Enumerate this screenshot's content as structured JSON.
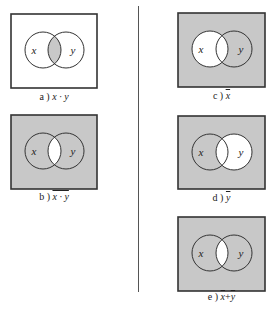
{
  "figure": {
    "colors": {
      "shade": "#c8c8c8",
      "white": "#ffffff",
      "stroke": "#333333"
    },
    "panels": [
      {
        "id": "a",
        "prefix": "a )",
        "expr": "x · y",
        "overline": false,
        "label_x": "x",
        "label_y": "y",
        "shading": "intersection",
        "box": {
          "x": 10,
          "y": 13,
          "w": 88,
          "h": 76
        },
        "caption_y": 97
      },
      {
        "id": "b",
        "prefix": "b )",
        "expr": "x · y",
        "overline": true,
        "label_x": "x",
        "label_y": "y",
        "shading": "not-intersection",
        "box": {
          "x": 10,
          "y": 114,
          "w": 88,
          "h": 76
        },
        "caption_y": 197
      },
      {
        "id": "c",
        "prefix": "c )",
        "expr": "x",
        "overline": true,
        "label_x": "x",
        "label_y": "y",
        "shading": "not-x",
        "box": {
          "x": 177,
          "y": 12,
          "w": 89,
          "h": 76
        },
        "caption_y": 96
      },
      {
        "id": "d",
        "prefix": "d )",
        "expr": "y",
        "overline": true,
        "label_x": "x",
        "label_y": "y",
        "shading": "not-y",
        "box": {
          "x": 177,
          "y": 115,
          "w": 89,
          "h": 75
        },
        "caption_y": 198
      },
      {
        "id": "e",
        "prefix": "e )",
        "expr": "x+y",
        "expr_parts": [
          "x",
          "+",
          "y"
        ],
        "overline": true,
        "label_x": "x",
        "label_y": "y",
        "shading": "not-intersection",
        "box": {
          "x": 177,
          "y": 216,
          "w": 89,
          "h": 76
        },
        "caption_y": 297
      }
    ]
  }
}
